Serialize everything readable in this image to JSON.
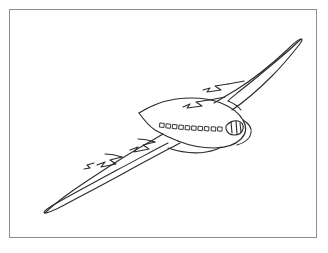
{
  "document": {
    "title": "Airplane Line Drawing",
    "background_color": "#ffffff",
    "width": 328,
    "height": 253
  },
  "frame": {
    "name": "figure-border",
    "border_color": "#8e8e8e",
    "border_width": 1,
    "fill_color": "#ffffff",
    "left": 9,
    "top": 9,
    "width": 308,
    "height": 229
  },
  "drawing": {
    "subject": "airplane",
    "style": "hand-drawn ink line art, outline only, no fill",
    "view": "three-quarter view from above and front, nose pointing right",
    "stroke_color": "#2b2b2b",
    "stroke_width": 1.1,
    "fill_color": "none",
    "parts": [
      {
        "name": "fuselage",
        "label": "Fuselage body",
        "description": "Elongated rounded body running from upper-left to lower-right, nose at right"
      },
      {
        "name": "left-wing",
        "label": "Left wing",
        "description": "Long swept wing extending to lower-left, tapering to a sharp point"
      },
      {
        "name": "right-wing",
        "label": "Right wing",
        "description": "Long swept wing extending to upper-right, ending in a rounded tip"
      },
      {
        "name": "left-engine-near",
        "label": "Left inboard engine",
        "description": "Zigzag nacelle outline on the left wing near the fuselage"
      },
      {
        "name": "left-engine-far",
        "label": "Left outboard engine",
        "description": "Zigzag nacelle outline further out on the left wing"
      },
      {
        "name": "right-engine-near",
        "label": "Right inboard engine",
        "description": "Zigzag nacelle outline on the right wing near the fuselage"
      },
      {
        "name": "right-engine-far",
        "label": "Right outboard engine",
        "description": "Zigzag nacelle outline further out on the right wing"
      },
      {
        "name": "cockpit-windows",
        "label": "Cockpit window band",
        "description": "Curved band of four segmented panes near the nose"
      },
      {
        "name": "passenger-windows",
        "label": "Passenger window row",
        "description": "Row of small square cabin windows along the fuselage"
      },
      {
        "name": "belly-line",
        "label": "Underside contour line",
        "description": "Curved line beneath the fuselage marking the belly"
      }
    ],
    "passenger_window_count": 10,
    "cockpit_window_panes": 4,
    "engine_count": 4
  },
  "caption": {
    "text": ""
  }
}
